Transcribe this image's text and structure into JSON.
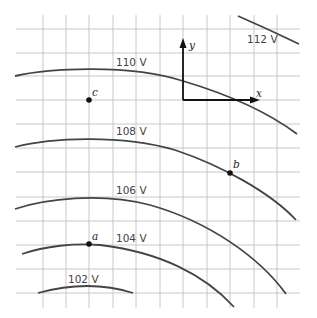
{
  "figure": {
    "equipotentials": [
      {
        "label": "102 V",
        "value": 102
      },
      {
        "label": "104 V",
        "value": 104
      },
      {
        "label": "106 V",
        "value": 106
      },
      {
        "label": "108 V",
        "value": 108
      },
      {
        "label": "110 V",
        "value": 110
      },
      {
        "label": "112 V",
        "value": 112
      }
    ],
    "points": [
      {
        "label": "a",
        "on": "104 V"
      },
      {
        "label": "b",
        "on": "108 V"
      },
      {
        "label": "c",
        "between": "108 V and 110 V"
      }
    ],
    "axes": {
      "x_label": "x",
      "y_label": "y"
    },
    "colors": {
      "grid": "#c8c8c8",
      "curve": "#444444",
      "axis": "#111111"
    }
  }
}
